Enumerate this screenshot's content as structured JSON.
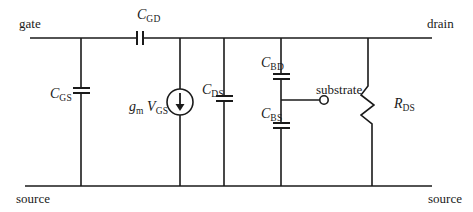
{
  "diagram": {
    "type": "small-signal MOSFET equivalent circuit",
    "colors": {
      "wire": "#1a1a1a",
      "background": "#ffffff",
      "text": "#1a1a1a"
    },
    "terminals": {
      "gate": "gate",
      "drain": "drain",
      "source_left": "source",
      "source_right": "source",
      "substrate": "substrate"
    },
    "components": {
      "cgd": {
        "symbol": "C",
        "sub": "GD",
        "kind": "capacitor"
      },
      "cgs": {
        "symbol": "C",
        "sub": "GS",
        "kind": "capacitor"
      },
      "gm": {
        "symbol": "g",
        "sub": "m",
        "kind": "current-source"
      },
      "vgs": {
        "symbol": "V",
        "sub": "GS"
      },
      "cds": {
        "symbol": "C",
        "sub": "DS",
        "kind": "capacitor"
      },
      "cbd": {
        "symbol": "C",
        "sub": "BD",
        "kind": "capacitor"
      },
      "cbs": {
        "symbol": "C",
        "sub": "BS",
        "kind": "capacitor"
      },
      "rds": {
        "symbol": "R",
        "sub": "DS",
        "kind": "resistor"
      }
    }
  }
}
